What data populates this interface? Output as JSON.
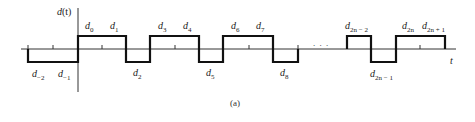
{
  "figure": {
    "caption": "(a)",
    "y_axis_label": "d(t)",
    "y_axis_label_parts": {
      "base": "d",
      "arg": "(t)"
    },
    "x_axis_label": "t",
    "ellipsis": ". . .",
    "colors": {
      "signal": "#111111",
      "axis": "#333333",
      "text": "#222222"
    }
  },
  "waveform": {
    "description": "Bipolar NRZ-like data signal d(t) with symbols d_k held for one bit period each",
    "levels": {
      "high": "+",
      "low": "-"
    },
    "left_segment": [
      {
        "symbol": "d_{-2}",
        "base": "d",
        "sub": "−2",
        "level": "low"
      },
      {
        "symbol": "d_{-1}",
        "base": "d",
        "sub": "−1",
        "level": "low"
      },
      {
        "symbol": "d_0",
        "base": "d",
        "sub": "0",
        "level": "high"
      },
      {
        "symbol": "d_1",
        "base": "d",
        "sub": "1",
        "level": "high"
      },
      {
        "symbol": "d_2",
        "base": "d",
        "sub": "2",
        "level": "low"
      },
      {
        "symbol": "d_3",
        "base": "d",
        "sub": "3",
        "level": "high"
      },
      {
        "symbol": "d_4",
        "base": "d",
        "sub": "4",
        "level": "high"
      },
      {
        "symbol": "d_5",
        "base": "d",
        "sub": "5",
        "level": "low"
      },
      {
        "symbol": "d_6",
        "base": "d",
        "sub": "6",
        "level": "high"
      },
      {
        "symbol": "d_7",
        "base": "d",
        "sub": "7",
        "level": "high"
      },
      {
        "symbol": "d_8",
        "base": "d",
        "sub": "8",
        "level": "low"
      }
    ],
    "right_segment": [
      {
        "symbol": "d_{2n-2}",
        "base": "d",
        "sub": "2n − 2",
        "level": "high"
      },
      {
        "symbol": "d_{2n-1}",
        "base": "d",
        "sub": "2n − 1",
        "level": "low"
      },
      {
        "symbol": "d_{2n}",
        "base": "d",
        "sub": "2n",
        "level": "high"
      },
      {
        "symbol": "d_{2n+1}",
        "base": "d",
        "sub": "2n + 1",
        "level": "high"
      }
    ]
  }
}
